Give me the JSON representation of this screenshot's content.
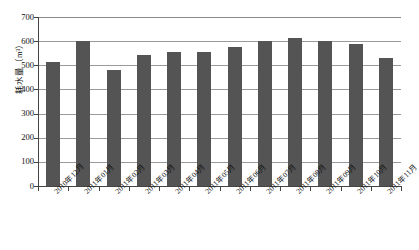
{
  "chart_data": {
    "type": "bar",
    "title": "",
    "xlabel": "",
    "ylabel": "耗水量（m³）",
    "ylim": [
      0,
      700
    ],
    "ytick_values": [
      0,
      100,
      200,
      300,
      400,
      500,
      600,
      700
    ],
    "ytick_labels": [
      "0",
      "100",
      "200",
      "300",
      "400",
      "500",
      "600",
      "700"
    ],
    "grid": true,
    "legend": "none",
    "bar_color": "#545454",
    "categories": [
      "2010年12月",
      "2011年01月",
      "2011年02月",
      "2011年03月",
      "2011年04月",
      "2011年05月",
      "2011年06月",
      "2011年07月",
      "2011年08月",
      "2011年09月",
      "2011年10月",
      "2011年11月"
    ],
    "values": [
      515,
      600,
      482,
      543,
      556,
      556,
      575,
      602,
      613,
      602,
      590,
      530
    ]
  }
}
